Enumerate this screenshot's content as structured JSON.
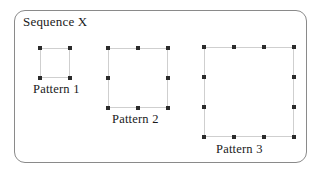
{
  "figure": {
    "title": "Sequence X",
    "border_color": "#8a8a8a",
    "background": "#ffffff"
  },
  "chart_data": {
    "type": "diagram",
    "title": "Sequence X",
    "dot_color": "#2b2b2b",
    "line_color": "#cfcfcf",
    "patterns": [
      {
        "label": "Pattern 1",
        "index": 1,
        "side_divisions": 1,
        "dots_total": 4,
        "side_length_px": 30,
        "square": {
          "x": 40,
          "y": 48,
          "w": 30,
          "h": 30
        },
        "label_pos": {
          "x": 33,
          "y": 82
        }
      },
      {
        "label": "Pattern 2",
        "index": 2,
        "side_divisions": 2,
        "dots_total": 8,
        "side_length_px": 60,
        "square": {
          "x": 108,
          "y": 48,
          "w": 60,
          "h": 60
        },
        "label_pos": {
          "x": 112,
          "y": 112
        }
      },
      {
        "label": "Pattern 3",
        "index": 3,
        "side_divisions": 3,
        "dots_total": 12,
        "side_length_px": 90,
        "square": {
          "x": 204,
          "y": 47,
          "w": 90,
          "h": 90
        },
        "label_pos": {
          "x": 216,
          "y": 142
        }
      }
    ]
  }
}
